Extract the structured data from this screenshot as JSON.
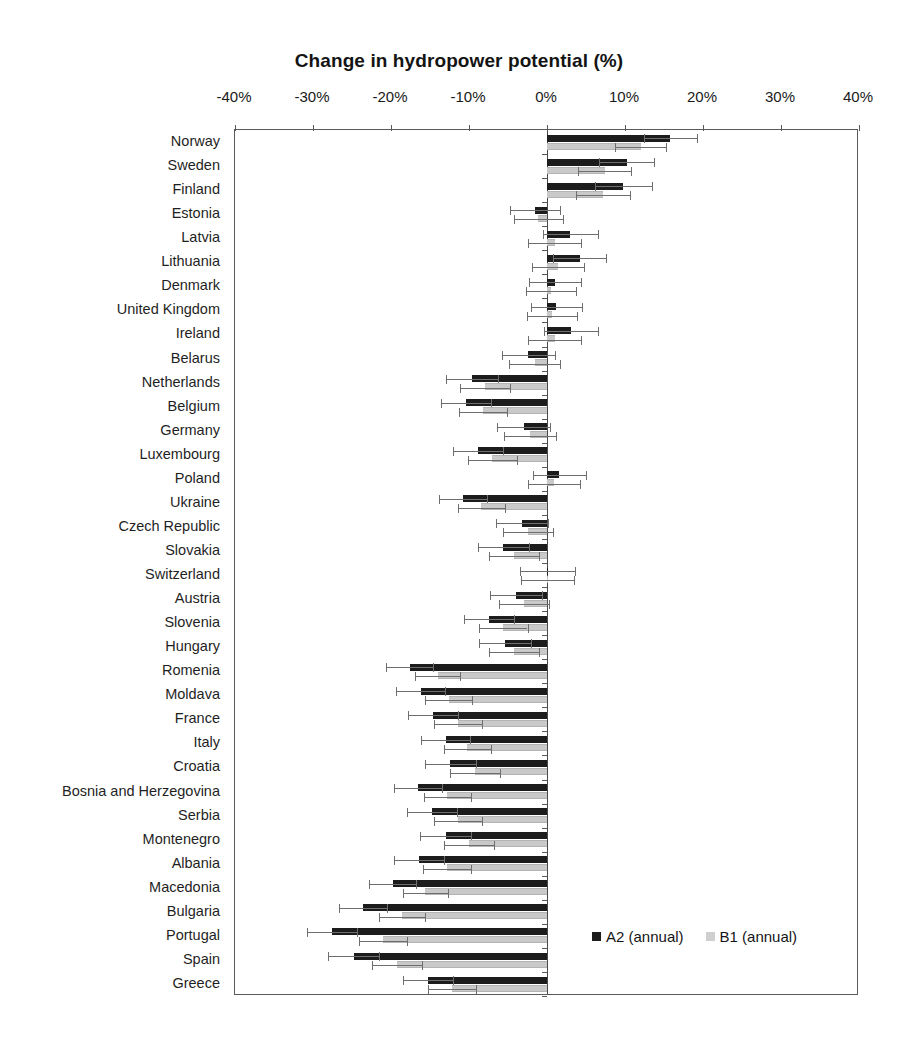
{
  "chart_data": {
    "type": "bar",
    "orientation": "horizontal",
    "title": "Change in hydropower potential (%)",
    "xlabel": "",
    "ylabel": "",
    "xlim": [
      -40,
      40
    ],
    "xticks": [
      -40,
      -30,
      -20,
      -10,
      0,
      10,
      20,
      30,
      40
    ],
    "xtick_labels": [
      "-40%",
      "-30%",
      "-20%",
      "-10%",
      "0%",
      "10%",
      "20%",
      "30%",
      "40%"
    ],
    "grid": false,
    "legend_position": "inside bottom-right",
    "error_bars": true,
    "categories": [
      "Norway",
      "Sweden",
      "Finland",
      "Estonia",
      "Latvia",
      "Lithuania",
      "Denmark",
      "United Kingdom",
      "Ireland",
      "Belarus",
      "Netherlands",
      "Belgium",
      "Germany",
      "Luxembourg",
      "Poland",
      "Ukraine",
      "Czech Republic",
      "Slovakia",
      "Switzerland",
      "Austria",
      "Slovenia",
      "Hungary",
      "Romenia",
      "Moldava",
      "France",
      "Italy",
      "Croatia",
      "Bosnia and Herzegovina",
      "Serbia",
      "Montenegro",
      "Albania",
      "Macedonia",
      "Bulgaria",
      "Portugal",
      "Spain",
      "Greece"
    ],
    "series": [
      {
        "name": "A2 (annual)",
        "color": "#1c1c1c",
        "values": [
          15.8,
          10.2,
          9.8,
          -1.5,
          3.0,
          4.2,
          1.0,
          1.2,
          3.1,
          -2.4,
          -9.6,
          -10.4,
          -3.0,
          -8.8,
          1.6,
          -10.8,
          -3.2,
          -5.6,
          0.1,
          -4.0,
          -7.4,
          -5.4,
          -17.6,
          -16.2,
          -14.6,
          -13.0,
          -12.4,
          -16.5,
          -14.8,
          -13.0,
          -16.4,
          -19.8,
          -23.6,
          -27.6,
          -24.8,
          -15.3
        ],
        "errors": [
          3.4,
          3.5,
          3.6,
          3.2,
          3.5,
          3.4,
          3.3,
          3.3,
          3.5,
          3.4,
          3.3,
          3.2,
          3.4,
          3.2,
          3.4,
          3.1,
          3.3,
          3.3,
          3.5,
          3.3,
          3.2,
          3.3,
          3.0,
          3.1,
          3.2,
          3.1,
          3.3,
          3.1,
          3.2,
          3.3,
          3.2,
          3.0,
          3.1,
          3.2,
          3.3,
          3.2
        ]
      },
      {
        "name": "B1 (annual)",
        "color": "#c9c9c9",
        "values": [
          12.0,
          7.4,
          7.2,
          -1.1,
          1.0,
          1.4,
          0.5,
          0.6,
          1.0,
          -1.6,
          -8.0,
          -8.2,
          -2.2,
          -7.0,
          0.9,
          -8.4,
          -2.4,
          -4.2,
          0.1,
          -3.0,
          -5.6,
          -4.2,
          -14.0,
          -12.6,
          -11.4,
          -10.2,
          -9.2,
          -12.8,
          -11.4,
          -10.0,
          -12.8,
          -15.6,
          -18.6,
          -21.0,
          -19.2,
          -12.2
        ],
        "errors": [
          3.3,
          3.4,
          3.5,
          3.1,
          3.4,
          3.3,
          3.2,
          3.2,
          3.4,
          3.3,
          3.2,
          3.1,
          3.3,
          3.1,
          3.3,
          3.0,
          3.2,
          3.2,
          3.4,
          3.2,
          3.1,
          3.2,
          2.9,
          3.0,
          3.1,
          3.0,
          3.2,
          3.0,
          3.1,
          3.2,
          3.1,
          2.9,
          3.0,
          3.1,
          3.2,
          3.1
        ]
      }
    ]
  },
  "legend": {
    "items": [
      {
        "label": "A2 (annual)",
        "swatch": "a2"
      },
      {
        "label": "B1 (annual)",
        "swatch": "b1"
      }
    ]
  }
}
